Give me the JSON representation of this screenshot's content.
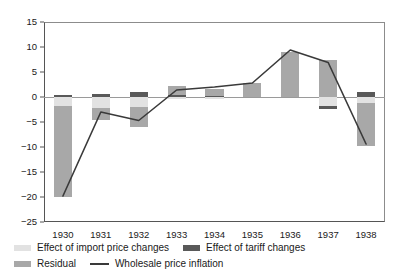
{
  "chart_data": {
    "type": "bar",
    "title": "",
    "xlabel": "",
    "ylabel": "",
    "categories": [
      "1930",
      "1931",
      "1932",
      "1933",
      "1934",
      "1935",
      "1936",
      "1937",
      "1938"
    ],
    "ylim": [
      -25,
      15
    ],
    "yticks": [
      15,
      10,
      5,
      0,
      -5,
      -10,
      -15,
      -20,
      -25
    ],
    "ytick_labels": [
      "15",
      "10",
      "5",
      "0",
      "-5",
      "-10",
      "-15",
      "-20",
      "-25"
    ],
    "grid": false,
    "legend_position": "below",
    "stacked": true,
    "series": [
      {
        "name": "Effect of import price changes",
        "color": "#e2e2e2",
        "values": [
          -1.8,
          -2.2,
          -2.0,
          -0.4,
          -0.4,
          0.0,
          0.0,
          -1.7,
          -1.2
        ]
      },
      {
        "name": "Effect of tariff changes",
        "color": "#595959",
        "values": [
          0.4,
          0.7,
          1.0,
          0.4,
          0.3,
          0.0,
          0.0,
          -0.7,
          1.1
        ]
      },
      {
        "name": "Residual",
        "color": "#a8a8a8",
        "values": [
          -18.2,
          -2.4,
          -4.0,
          1.8,
          1.4,
          2.8,
          9.1,
          7.4,
          -8.5
        ]
      }
    ],
    "line_series": {
      "name": "Wholesale price inflation",
      "color": "#3a3a3a",
      "values": [
        -19.8,
        -3.0,
        -4.7,
        1.4,
        2.0,
        2.8,
        9.4,
        6.9,
        -9.4
      ]
    }
  },
  "legend": {
    "items": [
      {
        "label": "Effect of import price changes",
        "marker": "swatch",
        "color": "#e2e2e2"
      },
      {
        "label": "Effect of tariff changes",
        "marker": "swatch",
        "color": "#595959"
      },
      {
        "label": "Residual",
        "marker": "swatch",
        "color": "#a8a8a8"
      },
      {
        "label": "Wholesale price inflation",
        "marker": "line",
        "color": "#3a3a3a"
      }
    ]
  }
}
